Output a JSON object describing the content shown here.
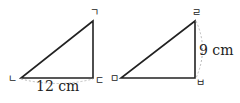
{
  "triangles": [
    {
      "name": "triangle-1",
      "vertices": {
        "top": "ㄱ",
        "left": "ㄴ",
        "right": "ㄷ"
      },
      "measurement": {
        "side": "ㄴㄷ",
        "label": "12 cm"
      }
    },
    {
      "name": "triangle-2",
      "vertices": {
        "top": "ㄹ",
        "left": "ㅁ",
        "right": "ㅂ"
      },
      "measurement": {
        "side": "ㄹㅂ",
        "label": "9 cm"
      }
    }
  ]
}
